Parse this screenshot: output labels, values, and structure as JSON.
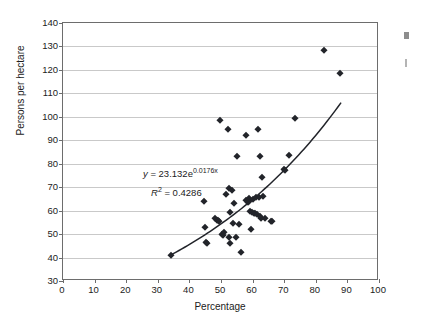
{
  "chart_data": {
    "type": "scatter",
    "title": "",
    "xlabel": "Percentage",
    "ylabel": "Persons per hectare",
    "xlim": [
      0,
      100
    ],
    "ylim": [
      30,
      140
    ],
    "xticks": [
      0,
      10,
      20,
      30,
      40,
      50,
      60,
      70,
      80,
      90,
      100
    ],
    "yticks": [
      30,
      40,
      50,
      60,
      70,
      80,
      90,
      100,
      110,
      120,
      130,
      140
    ],
    "grid": "horizontal",
    "legend": "none",
    "marker": "diamond",
    "marker_color": "#22242a",
    "annotations": [
      "y = 23.132e0.0176x",
      "R2 = 0.4286"
    ],
    "equation": {
      "lead": "y",
      "eq": " = ",
      "coefficient": "23.132",
      "base": "e",
      "exponent": "0.0176x"
    },
    "r_squared": {
      "symbol": "R",
      "power": "2",
      "eq": " = ",
      "value": "0.4286"
    },
    "trendline": {
      "type": "exponential",
      "formula": "y = 23.132 * exp(0.0176 * x)",
      "x_start": 34,
      "x_end": 88,
      "y_start": 41,
      "y_end": 109
    },
    "points": [
      [
        34.2,
        41.0
      ],
      [
        44.5,
        64.0
      ],
      [
        45.0,
        53.2
      ],
      [
        45.3,
        46.8
      ],
      [
        45.6,
        46.2
      ],
      [
        48.2,
        56.8
      ],
      [
        48.6,
        56.2
      ],
      [
        49.0,
        55.9
      ],
      [
        49.3,
        55.4
      ],
      [
        49.6,
        98.8
      ],
      [
        50.3,
        50.2
      ],
      [
        50.6,
        49.6
      ],
      [
        51.0,
        51.0
      ],
      [
        51.6,
        67.2
      ],
      [
        52.2,
        94.9
      ],
      [
        52.4,
        69.6
      ],
      [
        52.6,
        48.9
      ],
      [
        52.8,
        46.0
      ],
      [
        53.0,
        59.6
      ],
      [
        53.4,
        68.8
      ],
      [
        53.8,
        54.6
      ],
      [
        54.2,
        63.4
      ],
      [
        54.6,
        48.6
      ],
      [
        55.2,
        83.4
      ],
      [
        55.6,
        54.4
      ],
      [
        56.3,
        42.4
      ],
      [
        57.8,
        64.6
      ],
      [
        58.0,
        92.3
      ],
      [
        58.4,
        63.6
      ],
      [
        58.8,
        64.2
      ],
      [
        59.0,
        65.4
      ],
      [
        59.2,
        59.8
      ],
      [
        59.4,
        52.0
      ],
      [
        59.8,
        59.4
      ],
      [
        60.2,
        64.8
      ],
      [
        60.4,
        59.2
      ],
      [
        60.8,
        58.8
      ],
      [
        61.2,
        65.8
      ],
      [
        61.4,
        58.4
      ],
      [
        61.8,
        94.7
      ],
      [
        62.0,
        66.0
      ],
      [
        62.2,
        83.4
      ],
      [
        62.4,
        57.6
      ],
      [
        62.8,
        57.0
      ],
      [
        63.0,
        74.4
      ],
      [
        63.4,
        66.2
      ],
      [
        63.8,
        56.8
      ],
      [
        65.8,
        55.6
      ],
      [
        66.0,
        55.4
      ],
      [
        69.8,
        77.6
      ],
      [
        70.2,
        77.4
      ],
      [
        71.6,
        83.8
      ],
      [
        73.4,
        99.6
      ],
      [
        82.5,
        128.6
      ],
      [
        87.5,
        118.5
      ]
    ]
  },
  "axis": {
    "x_title": "Percentage",
    "y_title": "Persons per hectare"
  }
}
